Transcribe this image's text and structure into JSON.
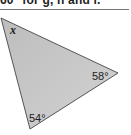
{
  "header": {
    "instruction_fragment": "60° for g, h and i."
  },
  "diagram": {
    "shape": "triangle",
    "fill_color": "#c4c4c4",
    "stroke_color": "#555555",
    "angles": [
      {
        "vertex": "top-left",
        "label": "x"
      },
      {
        "vertex": "right",
        "label": "58°"
      },
      {
        "vertex": "bottom",
        "label": "54°"
      }
    ]
  }
}
